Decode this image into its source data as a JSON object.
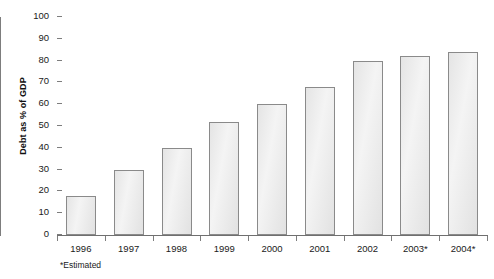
{
  "chart_data": {
    "type": "bar",
    "title": "",
    "xlabel": "",
    "ylabel": "Debt as % of GDP",
    "categories": [
      "1996",
      "1997",
      "1998",
      "1999",
      "2000",
      "2001",
      "2002",
      "2003*",
      "2004*"
    ],
    "values": [
      18,
      30,
      40,
      52,
      60,
      68,
      80,
      82,
      84
    ],
    "ylim": [
      0,
      100
    ],
    "ytick_step": 10,
    "yticks": [
      "100",
      "90",
      "80",
      "70",
      "60",
      "50",
      "40",
      "30",
      "20",
      "10",
      "0"
    ],
    "grid": false,
    "legend": null,
    "footnote": "*Estimated",
    "bar_fill_color": "#e9e9e9",
    "bar_border_color": "#8a8a8a",
    "axis_color": "#7d7d7d",
    "text_color": "#1a1a1a"
  }
}
